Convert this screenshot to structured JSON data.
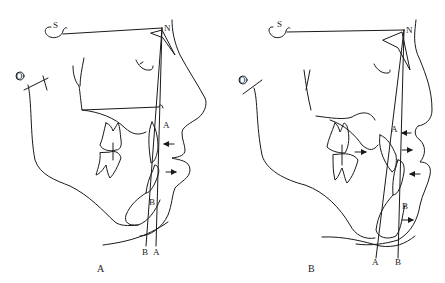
{
  "panels": [
    {
      "caption": "A",
      "landmarks": {
        "sella": "S",
        "nasion": "N",
        "orbitale": "O",
        "point_a": "A",
        "point_b": "B"
      },
      "line_labels": [
        "B",
        "A"
      ],
      "arrows": [
        "upper-lip-arrow-left",
        "lower-lip-arrow-right"
      ]
    },
    {
      "caption": "B",
      "landmarks": {
        "sella": "S",
        "nasion": "N",
        "orbitale": "O",
        "point_a": "A",
        "point_b": "B"
      },
      "line_labels": [
        "A",
        "B"
      ],
      "arrows": [
        "point-a-arrow-left",
        "upper-incisor-arrow-right",
        "molar-arrow-right",
        "lower-lip-arrow-left",
        "chin-arrow-right"
      ]
    }
  ]
}
